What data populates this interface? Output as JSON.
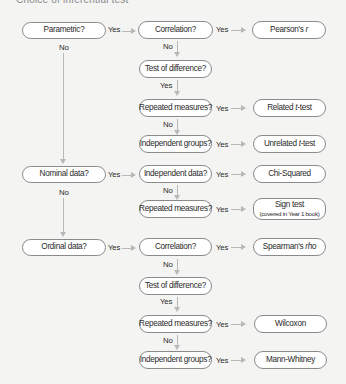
{
  "header": {
    "title_cut": "Choice of inferential test"
  },
  "left": {
    "parametric": "Parametric?",
    "nominal": "Nominal data?",
    "ordinal": "Ordinal data?"
  },
  "middle": {
    "p_correlation": "Correlation?",
    "p_test_difference": "Test of difference?",
    "p_repeated": "Repeated measures?",
    "p_independent": "Independent groups?",
    "n_independent_data": "Independent data?",
    "n_repeated": "Repeated measures?",
    "o_correlation": "Correlation?",
    "o_test_difference": "Test of difference?",
    "o_repeated": "Repeated measures?",
    "o_independent": "Independent groups?"
  },
  "right": {
    "pearson_prefix": "Pearson's ",
    "pearson_italic": "r",
    "related_prefix": "Related ",
    "related_italic": "t",
    "related_suffix": "-test",
    "unrelated_prefix": "Unrelated ",
    "unrelated_italic": "t",
    "unrelated_suffix": "-test",
    "chi_squared": "Chi-Squared",
    "sign_test": "Sign test",
    "sign_test_note": "(covered in Year 1 book)",
    "spearman_prefix": "Spearman's ",
    "spearman_italic": "rho",
    "wilcoxon": "Wilcoxon",
    "mann_whitney": "Mann-Whitney"
  },
  "labels": {
    "yes": "Yes",
    "no": "No"
  },
  "colors": {
    "arrow": "#b8b8b8",
    "border": "#8a8a8a",
    "box_fill": "#ffffff",
    "background": "#f4f4f3"
  }
}
